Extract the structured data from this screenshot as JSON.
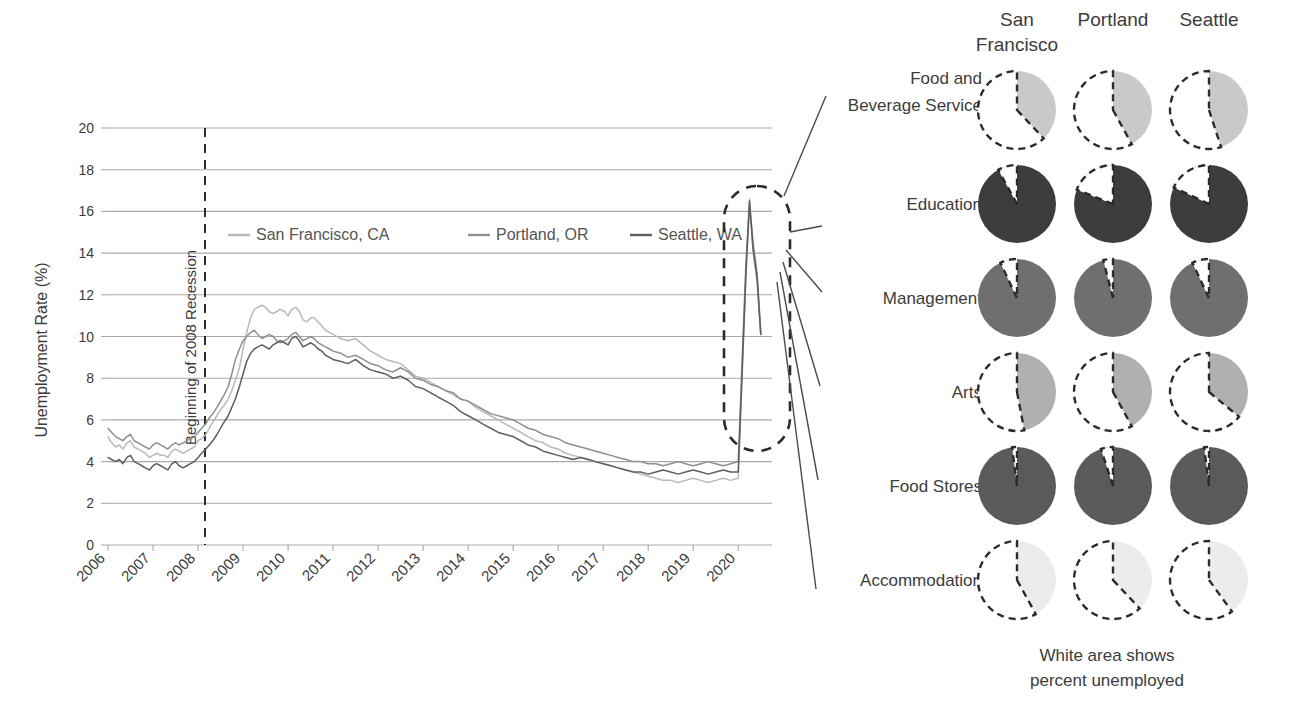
{
  "chart_data": [
    {
      "type": "line",
      "title": "",
      "xlabel": "",
      "ylabel": "Unemployment Rate (%)",
      "ylim": [
        0,
        20
      ],
      "ytick_step": 2,
      "yticks": [
        "0",
        "2",
        "4",
        "6",
        "8",
        "10",
        "12",
        "14",
        "16",
        "18",
        "20"
      ],
      "xlim": [
        2006,
        2020.75
      ],
      "xticks": [
        "2006",
        "2007",
        "2008",
        "2009",
        "2010",
        "2011",
        "2012",
        "2013",
        "2014",
        "2015",
        "2016",
        "2017",
        "2018",
        "2019",
        "2020"
      ],
      "grid": "horizontal",
      "legend_position": "inside-upper-left",
      "annotations": [
        {
          "name": "recession-line",
          "text": "Beginning of 2008 Recession",
          "x": 2007.75,
          "style": "dashed-vertical"
        },
        {
          "name": "covid-spike-callout",
          "text": "",
          "style": "dashed-ellipse",
          "about": "2020 COVID-19 unemployment spike"
        }
      ],
      "series": [
        {
          "name": "San Francisco, CA",
          "color": "#b9b9b9",
          "x": [
            2006.0,
            2006.08,
            2006.17,
            2006.25,
            2006.33,
            2006.42,
            2006.5,
            2006.58,
            2006.67,
            2006.75,
            2006.83,
            2006.92,
            2007.0,
            2007.08,
            2007.17,
            2007.25,
            2007.33,
            2007.42,
            2007.5,
            2007.58,
            2007.67,
            2007.75,
            2007.83,
            2007.92,
            2008.0,
            2008.08,
            2008.17,
            2008.25,
            2008.33,
            2008.42,
            2008.5,
            2008.58,
            2008.67,
            2008.75,
            2008.83,
            2008.92,
            2009.0,
            2009.08,
            2009.17,
            2009.25,
            2009.33,
            2009.42,
            2009.5,
            2009.58,
            2009.67,
            2009.75,
            2009.83,
            2009.92,
            2010.0,
            2010.08,
            2010.17,
            2010.25,
            2010.33,
            2010.42,
            2010.5,
            2010.58,
            2010.67,
            2010.75,
            2010.83,
            2010.92,
            2011.0,
            2011.17,
            2011.33,
            2011.5,
            2011.67,
            2011.83,
            2012.0,
            2012.17,
            2012.33,
            2012.5,
            2012.67,
            2012.83,
            2013.0,
            2013.17,
            2013.33,
            2013.5,
            2013.67,
            2013.83,
            2014.0,
            2014.17,
            2014.33,
            2014.5,
            2014.67,
            2014.83,
            2015.0,
            2015.17,
            2015.33,
            2015.5,
            2015.67,
            2015.83,
            2016.0,
            2016.17,
            2016.33,
            2016.5,
            2016.67,
            2016.83,
            2017.0,
            2017.17,
            2017.33,
            2017.5,
            2017.67,
            2017.83,
            2018.0,
            2018.17,
            2018.33,
            2018.5,
            2018.67,
            2018.83,
            2019.0,
            2019.17,
            2019.33,
            2019.5,
            2019.67,
            2019.83,
            2020.0,
            2020.17,
            2020.25,
            2020.33,
            2020.42,
            2020.5
          ],
          "y": [
            5.2,
            4.9,
            4.7,
            4.8,
            4.6,
            4.9,
            5.0,
            4.7,
            4.6,
            4.5,
            4.4,
            4.2,
            4.3,
            4.4,
            4.3,
            4.3,
            4.2,
            4.5,
            4.6,
            4.5,
            4.4,
            4.5,
            4.6,
            4.7,
            5.0,
            5.1,
            5.3,
            5.6,
            5.9,
            6.2,
            6.5,
            6.7,
            7.0,
            7.4,
            7.9,
            8.5,
            9.4,
            10.2,
            10.9,
            11.3,
            11.4,
            11.5,
            11.4,
            11.2,
            11.1,
            11.2,
            11.3,
            11.2,
            11.0,
            11.3,
            11.4,
            11.2,
            10.8,
            10.7,
            10.9,
            10.9,
            10.7,
            10.5,
            10.3,
            10.2,
            10.1,
            9.9,
            9.8,
            9.9,
            9.6,
            9.3,
            9.1,
            8.9,
            8.8,
            8.7,
            8.4,
            8.1,
            8.0,
            7.8,
            7.6,
            7.4,
            7.2,
            7.0,
            6.9,
            6.6,
            6.4,
            6.2,
            6.0,
            5.8,
            5.6,
            5.4,
            5.2,
            5.0,
            4.9,
            4.7,
            4.6,
            4.4,
            4.3,
            4.2,
            4.1,
            4.0,
            3.9,
            3.8,
            3.7,
            3.6,
            3.5,
            3.4,
            3.3,
            3.2,
            3.1,
            3.1,
            3.0,
            3.1,
            3.2,
            3.1,
            3.0,
            3.1,
            3.2,
            3.1,
            3.2,
            12.8,
            16.6,
            14.0,
            12.6,
            10.1
          ]
        },
        {
          "name": "Portland, OR",
          "color": "#8f8f8f",
          "x": [
            2006.0,
            2006.08,
            2006.17,
            2006.25,
            2006.33,
            2006.42,
            2006.5,
            2006.58,
            2006.67,
            2006.75,
            2006.83,
            2006.92,
            2007.0,
            2007.08,
            2007.17,
            2007.25,
            2007.33,
            2007.42,
            2007.5,
            2007.58,
            2007.67,
            2007.75,
            2007.83,
            2007.92,
            2008.0,
            2008.08,
            2008.17,
            2008.25,
            2008.33,
            2008.42,
            2008.5,
            2008.58,
            2008.67,
            2008.75,
            2008.83,
            2008.92,
            2009.0,
            2009.08,
            2009.17,
            2009.25,
            2009.33,
            2009.42,
            2009.5,
            2009.58,
            2009.67,
            2009.75,
            2009.83,
            2009.92,
            2010.0,
            2010.08,
            2010.17,
            2010.25,
            2010.33,
            2010.42,
            2010.5,
            2010.58,
            2010.67,
            2010.75,
            2010.83,
            2010.92,
            2011.0,
            2011.17,
            2011.33,
            2011.5,
            2011.67,
            2011.83,
            2012.0,
            2012.17,
            2012.33,
            2012.5,
            2012.67,
            2012.83,
            2013.0,
            2013.17,
            2013.33,
            2013.5,
            2013.67,
            2013.83,
            2014.0,
            2014.17,
            2014.33,
            2014.5,
            2014.67,
            2014.83,
            2015.0,
            2015.17,
            2015.33,
            2015.5,
            2015.67,
            2015.83,
            2016.0,
            2016.17,
            2016.33,
            2016.5,
            2016.67,
            2016.83,
            2017.0,
            2017.17,
            2017.33,
            2017.5,
            2017.67,
            2017.83,
            2018.0,
            2018.17,
            2018.33,
            2018.5,
            2018.67,
            2018.83,
            2019.0,
            2019.17,
            2019.33,
            2019.5,
            2019.67,
            2019.83,
            2020.0,
            2020.17,
            2020.25,
            2020.33,
            2020.42,
            2020.5
          ],
          "y": [
            5.6,
            5.4,
            5.2,
            5.1,
            5.0,
            5.2,
            5.3,
            5.0,
            4.9,
            4.8,
            4.7,
            4.6,
            4.8,
            4.9,
            4.8,
            4.7,
            4.6,
            4.8,
            4.9,
            4.8,
            4.9,
            5.0,
            5.1,
            5.2,
            5.4,
            5.6,
            5.8,
            6.1,
            6.3,
            6.6,
            6.9,
            7.2,
            7.6,
            8.2,
            8.9,
            9.4,
            9.8,
            10.0,
            10.2,
            10.3,
            10.1,
            9.9,
            10.0,
            10.1,
            10.0,
            9.8,
            9.7,
            9.8,
            9.9,
            10.1,
            10.2,
            10.0,
            9.8,
            9.9,
            10.0,
            9.9,
            9.7,
            9.6,
            9.5,
            9.4,
            9.3,
            9.2,
            9.0,
            9.1,
            8.9,
            8.7,
            8.6,
            8.4,
            8.3,
            8.5,
            8.3,
            8.0,
            7.9,
            7.7,
            7.6,
            7.4,
            7.3,
            7.0,
            6.9,
            6.7,
            6.5,
            6.3,
            6.2,
            6.1,
            6.0,
            5.8,
            5.6,
            5.5,
            5.3,
            5.2,
            5.1,
            4.9,
            4.8,
            4.7,
            4.6,
            4.5,
            4.4,
            4.3,
            4.2,
            4.1,
            4.0,
            4.0,
            3.9,
            3.9,
            3.8,
            3.9,
            4.0,
            3.9,
            3.8,
            3.9,
            4.0,
            3.9,
            3.8,
            3.9,
            4.0,
            13.5,
            16.3,
            14.5,
            13.0,
            10.2
          ]
        },
        {
          "name": "Seattle, WA",
          "color": "#5e5e5e",
          "x": [
            2006.0,
            2006.08,
            2006.17,
            2006.25,
            2006.33,
            2006.42,
            2006.5,
            2006.58,
            2006.67,
            2006.75,
            2006.83,
            2006.92,
            2007.0,
            2007.08,
            2007.17,
            2007.25,
            2007.33,
            2007.42,
            2007.5,
            2007.58,
            2007.67,
            2007.75,
            2007.83,
            2007.92,
            2008.0,
            2008.08,
            2008.17,
            2008.25,
            2008.33,
            2008.42,
            2008.5,
            2008.58,
            2008.67,
            2008.75,
            2008.83,
            2008.92,
            2009.0,
            2009.08,
            2009.17,
            2009.25,
            2009.33,
            2009.42,
            2009.5,
            2009.58,
            2009.67,
            2009.75,
            2009.83,
            2009.92,
            2010.0,
            2010.08,
            2010.17,
            2010.25,
            2010.33,
            2010.42,
            2010.5,
            2010.58,
            2010.67,
            2010.75,
            2010.83,
            2010.92,
            2011.0,
            2011.17,
            2011.33,
            2011.5,
            2011.67,
            2011.83,
            2012.0,
            2012.17,
            2012.33,
            2012.5,
            2012.67,
            2012.83,
            2013.0,
            2013.17,
            2013.33,
            2013.5,
            2013.67,
            2013.83,
            2014.0,
            2014.17,
            2014.33,
            2014.5,
            2014.67,
            2014.83,
            2015.0,
            2015.17,
            2015.33,
            2015.5,
            2015.67,
            2015.83,
            2016.0,
            2016.17,
            2016.33,
            2016.5,
            2016.67,
            2016.83,
            2017.0,
            2017.17,
            2017.33,
            2017.5,
            2017.67,
            2017.83,
            2018.0,
            2018.17,
            2018.33,
            2018.5,
            2018.67,
            2018.83,
            2019.0,
            2019.17,
            2019.33,
            2019.5,
            2019.67,
            2019.83,
            2020.0,
            2020.17,
            2020.25,
            2020.33,
            2020.42,
            2020.5
          ],
          "y": [
            4.2,
            4.1,
            4.0,
            4.1,
            3.9,
            4.2,
            4.3,
            4.0,
            3.9,
            3.8,
            3.7,
            3.6,
            3.8,
            3.9,
            3.8,
            3.7,
            3.6,
            3.9,
            4.0,
            3.8,
            3.7,
            3.8,
            3.9,
            4.0,
            4.2,
            4.4,
            4.6,
            4.8,
            5.0,
            5.3,
            5.6,
            5.9,
            6.2,
            6.6,
            7.0,
            7.6,
            8.2,
            8.8,
            9.2,
            9.4,
            9.5,
            9.6,
            9.5,
            9.4,
            9.6,
            9.7,
            9.8,
            9.7,
            9.6,
            9.9,
            10.0,
            9.8,
            9.5,
            9.6,
            9.7,
            9.6,
            9.4,
            9.3,
            9.1,
            9.0,
            8.9,
            8.8,
            8.7,
            8.9,
            8.6,
            8.4,
            8.3,
            8.2,
            8.0,
            8.1,
            7.9,
            7.6,
            7.5,
            7.3,
            7.1,
            6.9,
            6.7,
            6.4,
            6.2,
            6.0,
            5.8,
            5.6,
            5.4,
            5.3,
            5.2,
            5.0,
            4.8,
            4.7,
            4.5,
            4.4,
            4.3,
            4.2,
            4.1,
            4.2,
            4.1,
            4.0,
            3.9,
            3.8,
            3.7,
            3.6,
            3.5,
            3.5,
            3.4,
            3.5,
            3.6,
            3.5,
            3.4,
            3.5,
            3.6,
            3.5,
            3.4,
            3.5,
            3.6,
            3.5,
            3.5,
            13.0,
            16.5,
            14.2,
            12.8,
            10.1
          ]
        }
      ]
    },
    {
      "type": "pie",
      "title": "",
      "note": "6 sectors x 3 cities; white area shows percent unemployed",
      "columns": [
        "San Francisco",
        "Portland",
        "Seattle"
      ],
      "rows": [
        {
          "sector": "Food and Beverage Service",
          "fill": "#c9c9c9",
          "unemployed_pct": [
            62,
            58,
            55
          ]
        },
        {
          "sector": "Education",
          "fill": "#3d3d3d",
          "unemployed_pct": [
            8,
            19,
            18
          ]
        },
        {
          "sector": "Management",
          "fill": "#6f6f6f",
          "unemployed_pct": [
            7,
            4,
            7
          ]
        },
        {
          "sector": "Arts",
          "fill": "#b0b0b0",
          "unemployed_pct": [
            53,
            58,
            64
          ]
        },
        {
          "sector": "Food Stores",
          "fill": "#5a5a5a",
          "unemployed_pct": [
            2,
            5,
            2
          ]
        },
        {
          "sector": "Accommodation",
          "fill": "#ececec",
          "unemployed_pct": [
            58,
            62,
            60
          ]
        }
      ],
      "caption": [
        "White area shows",
        "percent unemployed"
      ]
    }
  ],
  "line_chart": {
    "y_axis_title": "Unemployment Rate (%)",
    "y_ticks": [
      "20",
      "18",
      "16",
      "14",
      "12",
      "10",
      "8",
      "6",
      "4",
      "2",
      "0"
    ],
    "x_ticks": [
      "2006",
      "2007",
      "2008",
      "2009",
      "2010",
      "2011",
      "2012",
      "2013",
      "2014",
      "2015",
      "2016",
      "2017",
      "2018",
      "2019",
      "2020"
    ],
    "recession_label": "Beginning of 2008 Recession",
    "legend": [
      {
        "label": "San Francisco, CA",
        "color": "#b9b9b9"
      },
      {
        "label": "Portland, OR",
        "color": "#8f8f8f"
      },
      {
        "label": "Seattle, WA",
        "color": "#5e5e5e"
      }
    ]
  },
  "pie_panel": {
    "column_headers": [
      {
        "line1": "San",
        "line2": "Francisco"
      },
      {
        "line1": "Portland",
        "line2": ""
      },
      {
        "line1": "Seattle",
        "line2": ""
      }
    ],
    "row_labels": [
      {
        "line1": "Food and",
        "line2": "Beverage Service"
      },
      {
        "line1": "Education",
        "line2": ""
      },
      {
        "line1": "Management",
        "line2": ""
      },
      {
        "line1": "Arts",
        "line2": ""
      },
      {
        "line1": "Food Stores",
        "line2": ""
      },
      {
        "line1": "Accommodation",
        "line2": ""
      }
    ],
    "caption_line1": "White area shows",
    "caption_line2": "percent unemployed"
  },
  "colors": {
    "grid": "#a9a9a9",
    "text": "#3c3c3c",
    "sf_line": "#b9b9b9",
    "pdx_line": "#8f8f8f",
    "sea_line": "#5e5e5e",
    "dashed": "#2b2b2b"
  }
}
